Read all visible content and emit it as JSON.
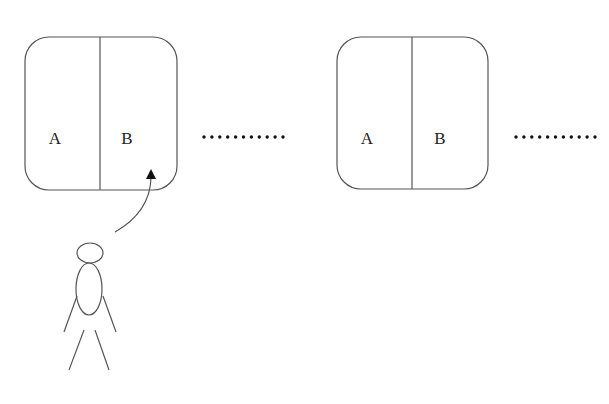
{
  "diagram": {
    "title_partial": "",
    "stroke_color": "#555555",
    "compartments": [
      {
        "id": "unit-1",
        "x": 25,
        "y": 37,
        "width": 152,
        "height": 153,
        "radius": 24,
        "divider_x": 100,
        "left_label": "A",
        "right_label": "B",
        "left_label_pos": [
          55,
          144
        ],
        "right_label_pos": [
          127,
          144
        ]
      },
      {
        "id": "unit-2",
        "x": 337,
        "y": 37,
        "width": 151,
        "height": 152,
        "radius": 24,
        "divider_x": 412,
        "left_label": "A",
        "right_label": "B",
        "left_label_pos": [
          367,
          144
        ],
        "right_label_pos": [
          440,
          144
        ]
      }
    ],
    "ellipsis_rows": [
      {
        "x_start": 204,
        "x_end": 283,
        "y": 137,
        "count": 11
      },
      {
        "x_start": 516,
        "x_end": 595,
        "y": 137,
        "count": 11
      }
    ],
    "arrow": {
      "from": [
        115,
        232
      ],
      "control": [
        150,
        212
      ],
      "to": [
        151,
        178
      ],
      "tip": [
        151,
        169
      ],
      "target": "unit-1 compartment B"
    },
    "person": {
      "head": {
        "cx": 90,
        "cy": 253,
        "rx": 13,
        "ry": 10
      },
      "body": {
        "cx": 89,
        "cy": 289,
        "rx": 13,
        "ry": 26
      },
      "arms": [
        [
          77,
          296,
          64,
          332
        ],
        [
          103,
          296,
          116,
          332
        ]
      ],
      "legs": [
        [
          84,
          330,
          69,
          370
        ],
        [
          95,
          330,
          109,
          370
        ]
      ]
    }
  }
}
